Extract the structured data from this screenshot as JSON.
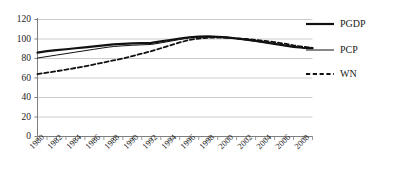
{
  "chart_data": {
    "type": "line",
    "title": "",
    "subtitle": "",
    "xlabel": "",
    "ylabel": "",
    "xlim": [
      1980,
      2009
    ],
    "ylim": [
      0,
      120
    ],
    "ytick_labels": [
      "0",
      "20",
      "40",
      "60",
      "80",
      "100",
      "120"
    ],
    "yticks": [
      0,
      20,
      40,
      60,
      80,
      100,
      120
    ],
    "grid": true,
    "grid_axis": "y",
    "legend_position": "right",
    "x": [
      1980,
      1981,
      1982,
      1983,
      1984,
      1985,
      1986,
      1987,
      1988,
      1989,
      1990,
      1991,
      1992,
      1993,
      1994,
      1995,
      1996,
      1997,
      1998,
      1999,
      2000,
      2001,
      2002,
      2003,
      2004,
      2005,
      2006,
      2007,
      2008,
      2009
    ],
    "xtick_labels": [
      "1980",
      "1982",
      "1984",
      "1986",
      "1988",
      "1990",
      "1992",
      "1994",
      "1996",
      "1998",
      "2000",
      "2002",
      "2004",
      "2006",
      "2008"
    ],
    "xtick_values": [
      1980,
      1982,
      1984,
      1986,
      1988,
      1990,
      1992,
      1994,
      1996,
      1998,
      2000,
      2002,
      2004,
      2006,
      2008
    ],
    "series": [
      {
        "name": "PGDP",
        "style": "solid-thick",
        "color": "#111111",
        "values": [
          86,
          87.5,
          88.5,
          89.5,
          90.5,
          91.5,
          92.5,
          93.5,
          94.5,
          95,
          95.5,
          95.8,
          96,
          97.5,
          99,
          100.5,
          101.8,
          102.5,
          102.6,
          102.3,
          101.6,
          100.5,
          99.3,
          98,
          96.5,
          95,
          93.5,
          92,
          91,
          90.5
        ]
      },
      {
        "name": "PCP",
        "style": "solid-thin",
        "color": "#111111",
        "values": [
          80.5,
          82,
          83.5,
          85,
          86.5,
          88,
          89.5,
          91,
          92.3,
          93,
          93.6,
          94,
          94.4,
          96,
          97.7,
          99.5,
          101,
          101.8,
          102,
          101.8,
          101.2,
          100.2,
          99,
          97.7,
          96.3,
          95,
          93.5,
          92,
          91,
          90.8
        ]
      },
      {
        "name": "WN",
        "style": "dashed",
        "color": "#111111",
        "values": [
          64,
          65.5,
          67,
          68.5,
          70.3,
          72,
          74,
          76,
          78,
          80,
          82.5,
          85,
          87.5,
          90.5,
          93.5,
          96.5,
          99,
          100.5,
          101.3,
          101.5,
          101.3,
          100.8,
          100,
          99,
          98,
          96.8,
          95.3,
          93.5,
          92,
          91
        ]
      }
    ],
    "legend": [
      {
        "label": "PGDP",
        "style": "solid-thick"
      },
      {
        "label": "PCP",
        "style": "solid-thin"
      },
      {
        "label": "WN",
        "style": "dashed"
      }
    ]
  },
  "colors": {
    "axis": "#7f7f7f",
    "grid": "#bfbfbf",
    "line": "#111111",
    "text": "#1a1a1a",
    "background": "#ffffff"
  }
}
